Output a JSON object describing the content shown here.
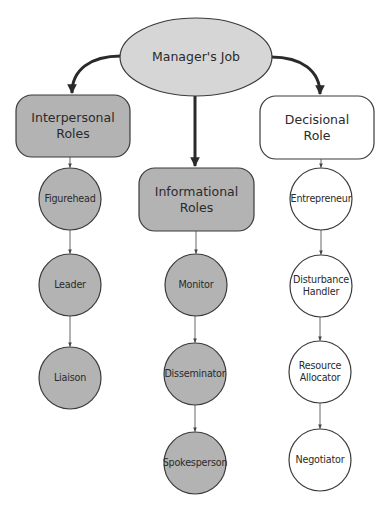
{
  "diagram": {
    "title": "Manager's Job",
    "colors": {
      "dark_fill": "#b3b3b3",
      "light_fill": "#ffffff",
      "root_fill": "#d6d6d6",
      "stroke": "#3a3a3a",
      "text": "#2a2a2a"
    },
    "root": {
      "label": "Manager's Job",
      "shape": "ellipse",
      "cx": 196,
      "cy": 57,
      "rx": 76,
      "ry": 39
    },
    "categories": [
      {
        "id": "interpersonal",
        "label": "Interpersonal\nRoles",
        "fill": "dark",
        "box": {
          "x": 16,
          "y": 95,
          "w": 114,
          "h": 62
        },
        "roles": [
          {
            "label": "Figurehead",
            "cx": 70,
            "cy": 199
          },
          {
            "label": "Leader",
            "cx": 70,
            "cy": 285
          },
          {
            "label": "Liaison",
            "cx": 70,
            "cy": 378
          }
        ]
      },
      {
        "id": "informational",
        "label": "Informational\nRoles",
        "fill": "dark",
        "box": {
          "x": 139,
          "y": 168,
          "w": 115,
          "h": 63
        },
        "roles": [
          {
            "label": "Monitor",
            "cx": 196,
            "cy": 285
          },
          {
            "label": "Disseminator",
            "cx": 195,
            "cy": 374
          },
          {
            "label": "Spokesperson",
            "cx": 195,
            "cy": 463
          }
        ]
      },
      {
        "id": "decisional",
        "label": "Decisional\nRole",
        "fill": "light",
        "box": {
          "x": 260,
          "y": 96,
          "w": 114,
          "h": 63
        },
        "roles": [
          {
            "label": "Entrepreneur",
            "cx": 321,
            "cy": 199
          },
          {
            "label": "Disturbance\nHandler",
            "cx": 321,
            "cy": 286
          },
          {
            "label": "Resource\nAllocator",
            "cx": 320,
            "cy": 372
          },
          {
            "label": "Negotiator",
            "cx": 320,
            "cy": 460
          }
        ]
      }
    ],
    "circle_radius": 31
  }
}
